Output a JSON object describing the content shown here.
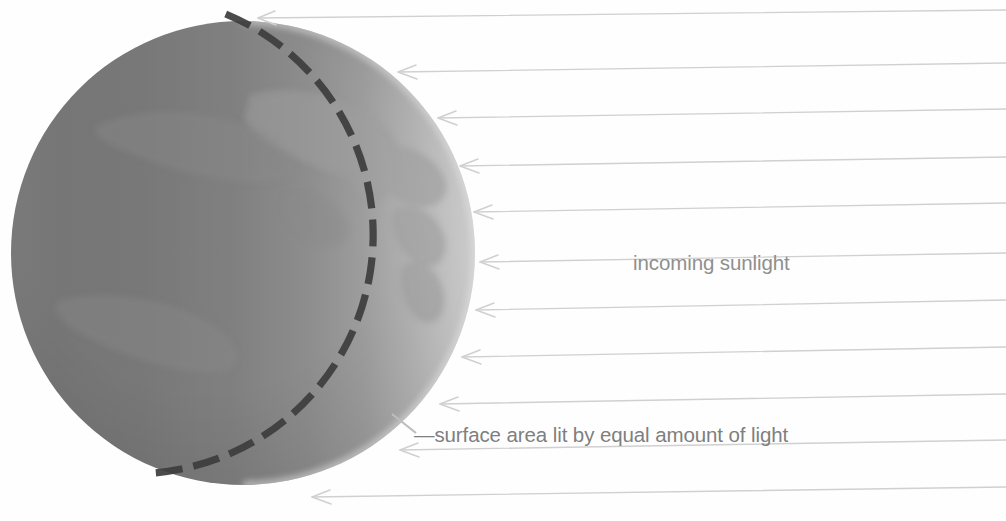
{
  "figure": {
    "background_color": "#fefefe",
    "labels": {
      "incoming_sunlight": "incoming sunlight",
      "surface_area": "—surface area lit by equal amount of light"
    },
    "sphere": {
      "name": "earth-globe",
      "center_x": 243,
      "center_y": 253,
      "radius": 232,
      "shading": {
        "dark_side_color": "#6f6f6f",
        "mid_color": "#8c8c8c",
        "lit_limb_color": "#d4d4d4",
        "direction": "left-dark-to-right-light"
      },
      "continents_color": "#9a9a9a"
    },
    "terminator_arc": {
      "name": "dashed-terminator-arc",
      "color": "#3c3c3c",
      "stroke_width": 7,
      "dash_pattern": "26 10",
      "start_angle_deg": -96,
      "end_angle_deg": 112
    },
    "rays": {
      "name": "incoming-sunlight-rays",
      "color": "#cfcfcf",
      "stroke_width": 1.3,
      "direction": "right-to-left",
      "count": 11,
      "lines": [
        {
          "y_left": 18,
          "y_right": 10,
          "x_tip": 258
        },
        {
          "y_left": 72,
          "y_right": 63,
          "x_tip": 398
        },
        {
          "y_left": 118,
          "y_right": 109,
          "x_tip": 438
        },
        {
          "y_left": 166,
          "y_right": 157,
          "x_tip": 460
        },
        {
          "y_left": 212,
          "y_right": 203,
          "x_tip": 474
        },
        {
          "y_left": 262,
          "y_right": 253,
          "x_tip": 480
        },
        {
          "y_left": 310,
          "y_right": 300,
          "x_tip": 476
        },
        {
          "y_left": 357,
          "y_right": 347,
          "x_tip": 462
        },
        {
          "y_left": 404,
          "y_right": 394,
          "x_tip": 440
        },
        {
          "y_left": 450,
          "y_right": 440,
          "x_tip": 400
        },
        {
          "y_left": 497,
          "y_right": 487,
          "x_tip": 312
        }
      ]
    },
    "leader_lines": {
      "incoming_sunlight_tail_x": 880,
      "surface_area_tail_x": 404
    }
  }
}
